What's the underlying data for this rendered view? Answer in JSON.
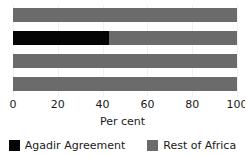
{
  "chart_data": {
    "type": "bar",
    "orientation": "horizontal",
    "stacked": true,
    "title": "",
    "subtitle": "",
    "xlabel": "Per cent",
    "ylabel": "",
    "xlim": [
      0,
      100
    ],
    "xticks": [
      0,
      20,
      40,
      60,
      80,
      100
    ],
    "xtick_labels": [
      "0",
      "20",
      "40",
      "60",
      "80",
      "100"
    ],
    "grid": true,
    "grid_axis": "x",
    "categories": [
      "bar-1",
      "bar-2",
      "bar-3",
      "bar-4"
    ],
    "series": [
      {
        "name": "Agadir Agreement",
        "color": "#050505",
        "values": [
          0,
          43,
          0,
          0
        ]
      },
      {
        "name": "Rest of Africa",
        "color": "#6b6b6b",
        "values": [
          100,
          57,
          100,
          100
        ]
      }
    ],
    "legend": {
      "position": "bottom",
      "entries": [
        {
          "label": "Agadir Agreement",
          "color": "#050505",
          "swatch": "square-swatch"
        },
        {
          "label": "Rest of Africa",
          "color": "#6b6b6b",
          "swatch": "square-swatch"
        }
      ]
    }
  },
  "colors": {
    "background": "#ffffff",
    "agadir": "#050505",
    "rest_of_africa": "#6b6b6b",
    "gridline": "#f0f0f0",
    "text": "#1a1a1a"
  }
}
